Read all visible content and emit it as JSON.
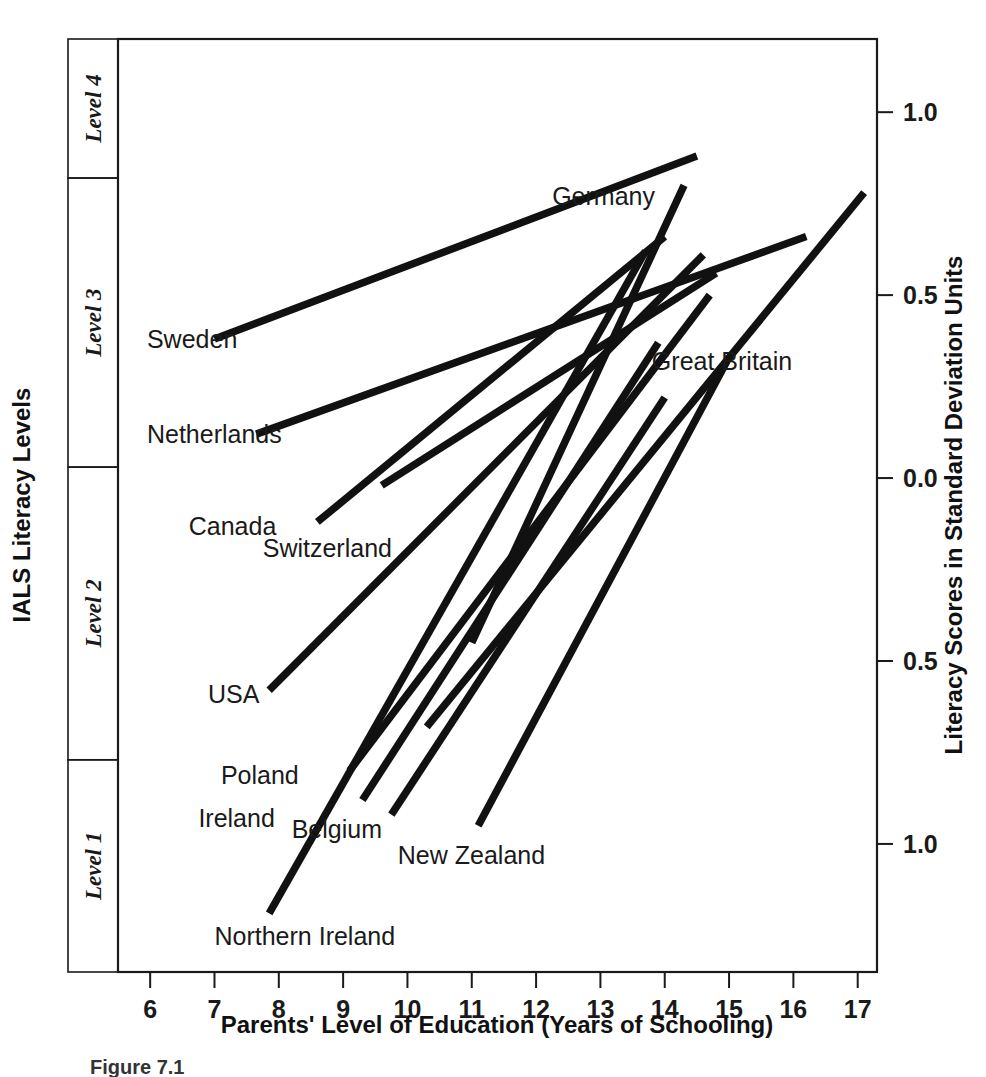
{
  "figure": {
    "caption": "Figure 7.1"
  },
  "chart_data": {
    "type": "line",
    "title": "",
    "xlabel": "Parents' Level of Education (Years of Schooling)",
    "ylabel": "Literacy Scores in Standard Deviation Units",
    "y2label": "IALS Literacy Levels",
    "grid": false,
    "legend": "none",
    "xlim": [
      5.5,
      17.3
    ],
    "ylim": [
      -1.35,
      1.2
    ],
    "xticks": [
      6,
      7,
      8,
      9,
      10,
      11,
      12,
      13,
      14,
      15,
      16,
      17
    ],
    "xticklabels": [
      "6",
      "7",
      "8",
      "9",
      "10",
      "11",
      "12",
      "13",
      "14",
      "15",
      "16",
      "17"
    ],
    "yticks": [
      1.0,
      0.5,
      0.0,
      -0.5,
      -1.0
    ],
    "yticklabels": [
      "1.0",
      "0.5",
      "0.0",
      "0.5",
      "1.0"
    ],
    "level_bands": [
      {
        "label": "Level 4",
        "y_top": 1.2,
        "y_bottom": 0.82
      },
      {
        "label": "Level 3",
        "y_top": 0.82,
        "y_bottom": 0.03
      },
      {
        "label": "Level 2",
        "y_top": 0.03,
        "y_bottom": -0.77
      },
      {
        "label": "Level 1",
        "y_top": -0.77,
        "y_bottom": -1.45
      }
    ],
    "series": [
      {
        "name": "Sweden",
        "x": [
          7.0,
          14.5
        ],
        "y": [
          0.38,
          0.88
        ]
      },
      {
        "name": "Netherlands",
        "x": [
          7.65,
          16.2
        ],
        "y": [
          0.12,
          0.66
        ]
      },
      {
        "name": "Canada",
        "x": [
          8.6,
          14.0
        ],
        "y": [
          -0.12,
          0.66
        ]
      },
      {
        "name": "Switzerland",
        "x": [
          9.6,
          14.8
        ],
        "y": [
          -0.02,
          0.56
        ]
      },
      {
        "name": "Great Britain",
        "x": [
          10.3,
          17.1
        ],
        "y": [
          -0.68,
          0.78
        ]
      },
      {
        "name": "Germany",
        "x": [
          11.0,
          14.3
        ],
        "y": [
          -0.45,
          0.8
        ]
      },
      {
        "name": "USA",
        "x": [
          7.85,
          14.6
        ],
        "y": [
          -0.58,
          0.61
        ]
      },
      {
        "name": "Poland",
        "x": [
          9.1,
          14.7
        ],
        "y": [
          -0.8,
          0.5
        ]
      },
      {
        "name": "Ireland",
        "x": [
          9.3,
          13.9
        ],
        "y": [
          -0.88,
          0.37
        ]
      },
      {
        "name": "Belgium",
        "x": [
          9.75,
          14.0
        ],
        "y": [
          -0.92,
          0.22
        ]
      },
      {
        "name": "New Zealand",
        "x": [
          11.1,
          15.0
        ],
        "y": [
          -0.95,
          0.33
        ]
      },
      {
        "name": "Northern Ireland",
        "x": [
          7.85,
          13.7
        ],
        "y": [
          -1.19,
          0.62
        ]
      }
    ],
    "annotations": [
      {
        "text": "Sweden",
        "x": 5.95,
        "y": 0.355,
        "anchor": "start"
      },
      {
        "text": "Netherlands",
        "x": 5.95,
        "y": 0.095,
        "anchor": "start"
      },
      {
        "text": "Canada",
        "x": 6.6,
        "y": -0.155,
        "anchor": "start"
      },
      {
        "text": "Switzerland",
        "x": 7.75,
        "y": -0.215,
        "anchor": "start"
      },
      {
        "text": "USA",
        "x": 6.9,
        "y": -0.615,
        "anchor": "start"
      },
      {
        "text": "Poland",
        "x": 7.1,
        "y": -0.835,
        "anchor": "start"
      },
      {
        "text": "Ireland",
        "x": 6.75,
        "y": -0.955,
        "anchor": "start"
      },
      {
        "text": "Belgium",
        "x": 8.2,
        "y": -0.985,
        "anchor": "start"
      },
      {
        "text": "New Zealand",
        "x": 9.85,
        "y": -1.055,
        "anchor": "start"
      },
      {
        "text": "Northern Ireland",
        "x": 7.0,
        "y": -1.275,
        "anchor": "start"
      },
      {
        "text": "Germany",
        "x": 12.25,
        "y": 0.745,
        "anchor": "start"
      },
      {
        "text": "Great Britain",
        "x": 13.8,
        "y": 0.295,
        "anchor": "start"
      }
    ]
  }
}
